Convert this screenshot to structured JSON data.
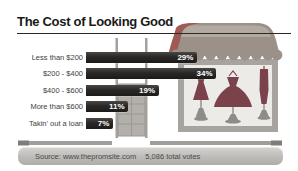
{
  "title": "The Cost of Looking Good",
  "chart_data": {
    "type": "bar",
    "orientation": "horizontal",
    "title": "The Cost of Looking Good",
    "categories": [
      "Less than $200",
      "$200 - $400",
      "$400 - $600",
      "More than $600",
      "Takin' out a loan"
    ],
    "values": [
      29,
      34,
      19,
      11,
      7
    ],
    "value_suffix": "%",
    "xlabel": "",
    "ylabel": "",
    "xlim": [
      0,
      34
    ],
    "grid": false,
    "legend": "none",
    "bar_color": "#2a2826",
    "value_label_color": "#ffffff"
  },
  "footer": {
    "source_label": "Source: www.thepromsite.com",
    "votes_label": "5,086 total votes"
  },
  "illustration": {
    "name": "dress-shop-storefront",
    "colors": {
      "awning": "#9b9189",
      "awning_highlight": "#b6ada4",
      "awning_red_edge": "#9f5a53",
      "window_frame": "#a7a4a0",
      "window_interior": "#edebe7",
      "dress": "#7a424b",
      "stand": "#8f8c88",
      "door": "#b3afab",
      "door_line": "#9b9894",
      "sidewalk": "#a09e9b",
      "sidewalk_cap": "#7f7d7a"
    }
  }
}
